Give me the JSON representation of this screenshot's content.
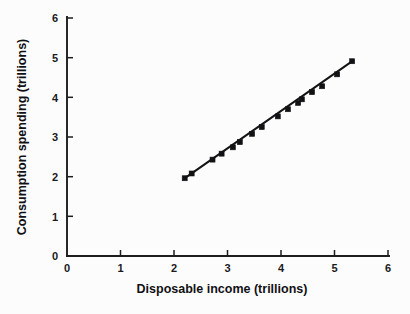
{
  "chart_data": {
    "type": "scatter",
    "title": "",
    "subtitle": "",
    "xlabel": "Disposable income (trillions)",
    "ylabel": "Consumption spending (trillions)",
    "xlim": [
      0,
      6
    ],
    "ylim": [
      0,
      6
    ],
    "xticks": [
      0,
      1,
      2,
      3,
      4,
      5,
      6
    ],
    "yticks": [
      0,
      1,
      2,
      3,
      4,
      5,
      6
    ],
    "xtick_labels": [
      "0",
      "1",
      "2",
      "3",
      "4",
      "5",
      "6"
    ],
    "ytick_labels": [
      "0",
      "1",
      "2",
      "3",
      "4",
      "5",
      "6"
    ],
    "grid": false,
    "legend": false,
    "legend_position": "none",
    "tick_direction": "in",
    "spines": [
      "left",
      "bottom"
    ],
    "marker_style": "filled-square",
    "marker_color": "#121214",
    "line_color": "#141416",
    "background_color": "#fcfcfd",
    "series": [
      {
        "name": "Consumption vs disposable income",
        "marker": "square",
        "points": [
          {
            "x": 2.2,
            "y": 1.96
          },
          {
            "x": 2.33,
            "y": 2.08
          },
          {
            "x": 2.72,
            "y": 2.43
          },
          {
            "x": 2.89,
            "y": 2.58
          },
          {
            "x": 3.1,
            "y": 2.74
          },
          {
            "x": 3.23,
            "y": 2.87
          },
          {
            "x": 3.46,
            "y": 3.08
          },
          {
            "x": 3.64,
            "y": 3.25
          },
          {
            "x": 3.94,
            "y": 3.52
          },
          {
            "x": 4.13,
            "y": 3.7
          },
          {
            "x": 4.32,
            "y": 3.86
          },
          {
            "x": 4.39,
            "y": 3.95
          },
          {
            "x": 4.58,
            "y": 4.13
          },
          {
            "x": 4.77,
            "y": 4.28
          },
          {
            "x": 5.05,
            "y": 4.58
          },
          {
            "x": 5.33,
            "y": 4.91
          }
        ]
      }
    ],
    "trend_line": {
      "name": "fitted line",
      "x_start": 2.19,
      "y_start": 1.95,
      "x_end": 5.34,
      "y_end": 4.92
    }
  },
  "axes": {
    "x_title": "Disposable income (trillions)",
    "y_title": "Consumption spending (trillions)",
    "x_tick_labels": [
      "0",
      "1",
      "2",
      "3",
      "4",
      "5",
      "6"
    ],
    "y_tick_labels": [
      "0",
      "1",
      "2",
      "3",
      "4",
      "5",
      "6"
    ]
  }
}
